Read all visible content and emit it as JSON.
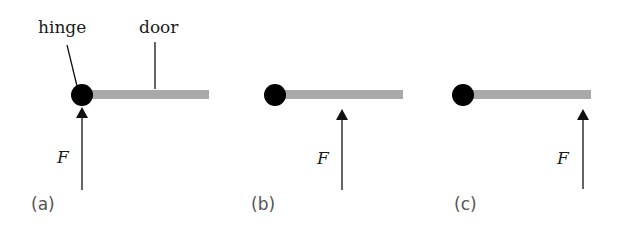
{
  "figure": {
    "labels": {
      "hinge": "hinge",
      "door": "door",
      "force": "F"
    },
    "colors": {
      "hinge": "#000000",
      "door": "#a9a9a9",
      "arrow": "#111111",
      "text": "#1a1a1a",
      "panel_label": "#555555"
    },
    "panels": [
      {
        "id": "a",
        "label": "(a)",
        "force_label": "F",
        "force_position": "at hinge"
      },
      {
        "id": "b",
        "label": "(b)",
        "force_label": "F",
        "force_position": "middle of door"
      },
      {
        "id": "c",
        "label": "(c)",
        "force_label": "F",
        "force_position": "end of door"
      }
    ]
  }
}
